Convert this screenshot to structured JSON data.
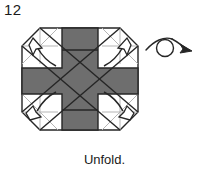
{
  "figure": {
    "step_number": "12",
    "caption": "Unfold.",
    "diagram_type": "origami-fold-diagram",
    "colors": {
      "paper_gray": "#6e6e6e",
      "paper_white": "#ffffff",
      "outline_dark": "#262626",
      "crease_light": "#b5b5b5",
      "text": "#1a1a1a",
      "background": "#ffffff"
    },
    "shape": {
      "name": "octagon-with-gray-cross",
      "description": "Octagonal folded paper with a gray cross (plus) shape overlaying white corner triangles"
    },
    "unfold_arrows": {
      "count": 4,
      "style": "hollow-outline-arrowhead-with-curved-tail",
      "directions": [
        "up-left",
        "up-right",
        "down-left",
        "down-right"
      ]
    },
    "turnover_symbol": {
      "name": "turn-over-arrow",
      "style": "looped-curve-with-solid-arrowhead",
      "direction": "right"
    }
  }
}
